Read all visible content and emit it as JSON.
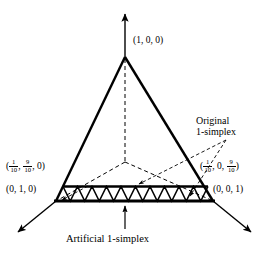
{
  "figure": {
    "type": "simplex-triangulation-diagram",
    "colors": {
      "stroke": "#000000",
      "background": "#ffffff"
    }
  },
  "labels": {
    "apex": {
      "text": "(1, 0, 0)",
      "parts": [
        "1",
        "0",
        "0"
      ]
    },
    "left_fraction": {
      "a": "0",
      "b_num": "1",
      "b_den": "10",
      "c_num": "9",
      "c_den": "10",
      "text": "(1/10, 9/10, 0)"
    },
    "left_vertex": {
      "text": "(0, 1, 0)"
    },
    "right_fraction": {
      "a_num": "1",
      "a_den": "10",
      "b": "0",
      "c_num": "9",
      "c_den": "10",
      "text": "(1/10, 0, 9/10)"
    },
    "right_vertex": {
      "text": "(0, 0, 1)"
    },
    "original_line1": "Original",
    "original_line2": "1-simplex",
    "artificial": "Artificial 1-simplex"
  },
  "geometry": {
    "apex": {
      "x": 125,
      "y": 57
    },
    "left_vertex": {
      "x": 56,
      "y": 201
    },
    "right_vertex": {
      "x": 213,
      "y": 201
    },
    "center_point": {
      "x": 125,
      "y": 162
    },
    "strip_top_y": 186,
    "strip_bottom_y": 201,
    "strip_left_x": 63,
    "strip_right_x": 208,
    "zigzag_triangle_count": 10,
    "axis_arrow_up_tip": {
      "x": 125,
      "y": 12
    },
    "axis_arrow_left_tip": {
      "x": 16,
      "y": 234
    },
    "axis_arrow_right_tip": {
      "x": 253,
      "y": 234
    },
    "caption_arrow_tip": {
      "x": 125,
      "y": 205
    },
    "caption_arrow_tail": {
      "x": 125,
      "y": 228
    }
  }
}
